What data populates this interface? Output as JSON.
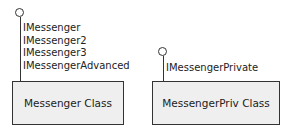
{
  "diagram": {
    "classes": [
      {
        "name": "Messenger Class",
        "interfaces": [
          "IMessenger",
          "IMessenger2",
          "IMessenger3",
          "IMessengerAdvanced"
        ]
      },
      {
        "name": "MessengerPriv Class",
        "interfaces": [
          "IMessengerPrivate"
        ]
      }
    ]
  }
}
